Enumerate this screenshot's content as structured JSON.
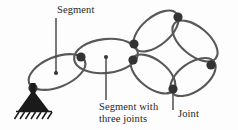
{
  "figure": {
    "kind": "mechanism-linkage-diagram",
    "background_color": "#fdfdfd",
    "line_color": "#555555",
    "joint_color": "#333333",
    "support_color": "#1a1a1a",
    "leader_color": "#4d4d4d"
  },
  "labels": {
    "segment": "Segment",
    "segment_with_three_joints_line1": "Segment with",
    "segment_with_three_joints_line2": "three joints",
    "joint": "Joint"
  },
  "leaders": [
    {
      "name": "leader-segment",
      "x": 56,
      "y_top": 18,
      "y_bottom": 73,
      "dot_at": "bottom",
      "dot_r": 2.0
    },
    {
      "name": "leader-segment-three-joints",
      "x": 106,
      "y_top": 57,
      "y_bottom": 100,
      "dot_at": "top",
      "dot_r": 2.0
    },
    {
      "name": "leader-joint",
      "x": 173,
      "y_top": 90,
      "y_bottom": 110,
      "dot_at": "none",
      "dot_r": 0
    }
  ],
  "segments": [
    {
      "name": "segment-1-grounded",
      "cx": 57,
      "cy": 72,
      "rx": 30,
      "ry": 15,
      "rotation": -22
    },
    {
      "name": "segment-2-three-joints",
      "cx": 106,
      "cy": 56,
      "rx": 32,
      "ry": 17,
      "rotation": -6
    },
    {
      "name": "segment-3-ring-upper-left",
      "cx": 156,
      "cy": 31,
      "rx": 27,
      "ry": 14,
      "rotation": -40
    },
    {
      "name": "segment-4-ring-upper-right",
      "cx": 195,
      "cy": 41,
      "rx": 27,
      "ry": 14,
      "rotation": 40
    },
    {
      "name": "segment-5-ring-lower-left",
      "cx": 153,
      "cy": 74,
      "rx": 26,
      "ry": 14,
      "rotation": 38
    },
    {
      "name": "segment-6-ring-lower-right",
      "cx": 193,
      "cy": 77,
      "rx": 26,
      "ry": 14,
      "rotation": -36
    }
  ],
  "joints": [
    {
      "name": "joint-ground-pin",
      "x": 33,
      "y": 88,
      "r": 4.6
    },
    {
      "name": "joint-1-2",
      "x": 81,
      "y": 57,
      "r": 4.6
    },
    {
      "name": "joint-2-upper-right",
      "x": 134,
      "y": 44,
      "r": 4.6
    },
    {
      "name": "joint-2-lower-right",
      "x": 133,
      "y": 60,
      "r": 4.6
    },
    {
      "name": "joint-ring-top",
      "x": 178,
      "y": 17,
      "r": 4.6
    },
    {
      "name": "joint-ring-right",
      "x": 211,
      "y": 65,
      "r": 4.6
    },
    {
      "name": "joint-ring-bottom-labeled",
      "x": 173,
      "y": 89,
      "r": 4.6
    }
  ],
  "support": {
    "name": "fixed-ground-support",
    "triangle": {
      "apex_x": 33,
      "apex_y": 90,
      "base_left_x": 18,
      "base_right_x": 49,
      "base_y": 111
    },
    "stem": {
      "x": 33,
      "y_top": 84,
      "y_bottom": 92,
      "width": 5
    },
    "hatch_baseline": {
      "x1": 16,
      "x2": 52,
      "y": 111
    },
    "hatch_count": 7,
    "hatch_length": 7,
    "hatch_slant": -7
  }
}
